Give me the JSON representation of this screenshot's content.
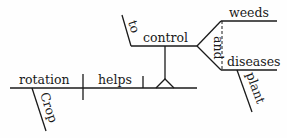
{
  "diagram": {
    "type": "sentence-diagram",
    "sentence": "Crop rotation helps to control weeds and plant diseases.",
    "subject": {
      "word": "rotation",
      "modifier": "Crop"
    },
    "verb": {
      "word": "helps"
    },
    "object_infinitive": {
      "preposition": "to",
      "verb": "control",
      "conjunction": "and",
      "compound_objects": [
        {
          "word": "weeds"
        },
        {
          "word": "diseases",
          "modifier": "plant"
        }
      ]
    }
  }
}
